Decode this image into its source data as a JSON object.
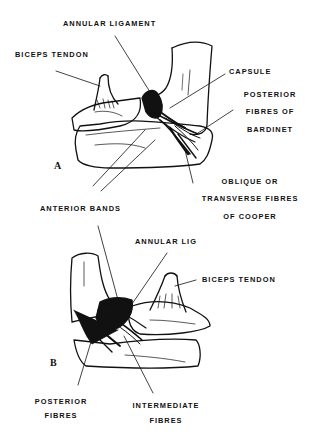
{
  "figure": {
    "panels": {
      "a": {
        "letter": "A",
        "labels": {
          "annular_ligament": "ANNULAR LIGAMENT",
          "biceps_tendon": "BICEPS TENDON",
          "capsule": "CAPSULE",
          "posterior_fibres_line1": "POSTERIOR",
          "posterior_fibres_line2": "FIBRES OF",
          "posterior_fibres_line3": "BARDINET",
          "anterior_bands": "ANTERIOR BANDS",
          "cooper_line1": "OBLIQUE OR",
          "cooper_line2": "TRANSVERSE FIBRES",
          "cooper_line3": "OF COOPER"
        }
      },
      "b": {
        "letter": "B",
        "labels": {
          "annular_lig": "ANNULAR LIG",
          "biceps_tendon": "BICEPS TENDON",
          "posterior_fibres_line1": "POSTERIOR",
          "posterior_fibres_line2": "FIBRES",
          "intermediate_fibres_line1": "INTERMEDIATE",
          "intermediate_fibres_line2": "FIBRES"
        }
      }
    }
  }
}
